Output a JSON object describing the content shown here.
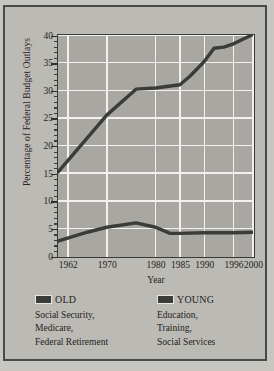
{
  "chart_data": {
    "type": "line",
    "title": "",
    "xlabel": "Year",
    "ylabel": "Percentage of Federal Budget Outlays",
    "xlim": [
      1960,
      2000
    ],
    "ylim": [
      0,
      40
    ],
    "yticks": [
      0,
      5,
      10,
      15,
      20,
      25,
      30,
      35,
      40
    ],
    "ytick_labels": [
      "0",
      "5",
      "10",
      "15",
      "20",
      "25",
      "30",
      "35",
      "40"
    ],
    "xticks": [
      1962,
      1970,
      1980,
      1985,
      1990,
      1996,
      2000
    ],
    "xtick_labels": [
      "1962",
      "1970",
      "1980",
      "1985",
      "1990",
      "1996",
      "2000"
    ],
    "grid": true,
    "legend_position": "below",
    "plot_background": "#a9a7a2",
    "gridline_color": "#f2f1ee",
    "series": [
      {
        "name": "OLD",
        "color": "#3b3b39",
        "x": [
          1960,
          1970,
          1976,
          1980,
          1985,
          1987,
          1990,
          1992,
          1994,
          1996,
          2000
        ],
        "values": [
          15.2,
          25.5,
          30.2,
          30.4,
          31.0,
          32.5,
          35.2,
          37.6,
          37.8,
          38.4,
          40.1
        ]
      },
      {
        "name": "YOUNG",
        "color": "#3b3b39",
        "x": [
          1960,
          1966,
          1970,
          1976,
          1980,
          1983,
          1985,
          1990,
          1996,
          2000
        ],
        "values": [
          2.7,
          4.3,
          5.2,
          6.0,
          5.2,
          4.1,
          4.1,
          4.2,
          4.2,
          4.3
        ]
      }
    ]
  },
  "legend": {
    "old": {
      "title": "OLD",
      "swatch_color": "#3b3b39",
      "lines": [
        "Social Security,",
        "Medicare,",
        "Federal Retirement"
      ]
    },
    "young": {
      "title": "YOUNG",
      "swatch_color": "#3b3b39",
      "lines": [
        "Education,",
        "Training,",
        "Social Services"
      ]
    }
  }
}
